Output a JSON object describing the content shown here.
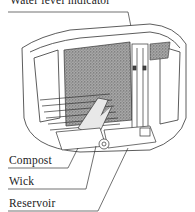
{
  "diagram": {
    "labels": {
      "water_level_indicator": "Water level indicator",
      "compost": "Compost",
      "wick": "Wick",
      "reservoir": "Reservoir"
    },
    "colors": {
      "line": "#333333",
      "compost_fill": "#8a8a8a",
      "background": "#ffffff"
    }
  }
}
